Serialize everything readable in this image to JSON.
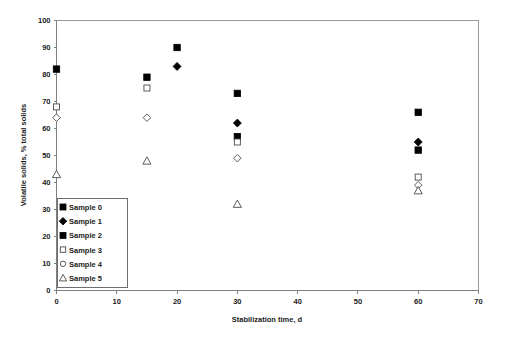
{
  "chart_data": {
    "type": "scatter",
    "title": "",
    "xlabel": "Stabilization time, d",
    "ylabel": "Volatile solids, % total solids",
    "xlim": [
      0,
      70
    ],
    "ylim": [
      0,
      100
    ],
    "xticks": [
      0,
      10,
      20,
      30,
      40,
      50,
      60,
      70
    ],
    "yticks": [
      0,
      10,
      20,
      30,
      40,
      50,
      60,
      70,
      80,
      90,
      100
    ],
    "grid": false,
    "legend_position": "lower-left-inside",
    "series": [
      {
        "name": "Sample 0",
        "marker": "filled-square",
        "x": [
          0,
          15,
          20,
          30,
          60
        ],
        "y": [
          82,
          79,
          90,
          73,
          66
        ]
      },
      {
        "name": "Sample 1",
        "marker": "filled-diamond",
        "x": [
          20,
          30,
          60
        ],
        "y": [
          83,
          62,
          55
        ]
      },
      {
        "name": "Sample 2",
        "marker": "filled-square",
        "x": [
          30,
          60
        ],
        "y": [
          57,
          52
        ]
      },
      {
        "name": "Sample 3",
        "marker": "open-square",
        "x": [
          0,
          15,
          30,
          60
        ],
        "y": [
          68,
          75,
          55,
          42
        ]
      },
      {
        "name": "Sample 4",
        "marker": "open-diamond",
        "x": [
          0,
          15,
          30,
          60
        ],
        "y": [
          64,
          64,
          49,
          39
        ]
      },
      {
        "name": "Sample 5",
        "marker": "open-triangle",
        "x": [
          0,
          15,
          30,
          60
        ],
        "y": [
          43,
          48,
          32,
          37
        ]
      }
    ]
  },
  "axes": {
    "x_tick_labels": [
      "0",
      "10",
      "20",
      "30",
      "40",
      "50",
      "60",
      "70"
    ],
    "y_tick_labels": [
      "0",
      "10",
      "20",
      "30",
      "40",
      "50",
      "60",
      "70",
      "80",
      "90",
      "100"
    ],
    "x_title": "Stabilization time, d",
    "y_title": "Volatile solids, % total solids"
  },
  "legend": {
    "items": [
      {
        "label": "Sample 0",
        "marker": "filled-square"
      },
      {
        "label": "Sample 1",
        "marker": "filled-diamond"
      },
      {
        "label": "Sample 2",
        "marker": "filled-square"
      },
      {
        "label": "Sample 3",
        "marker": "open-square"
      },
      {
        "label": "Sample 4",
        "marker": "open-circle"
      },
      {
        "label": "Sample 5",
        "marker": "open-triangle"
      }
    ]
  },
  "colors": {
    "marker_fill": "#000000",
    "marker_open_stroke": "#4a4a4a",
    "axis": "#808080",
    "frame": "#9a9a9a",
    "background": "#ffffff",
    "text": "#1a1a1a"
  }
}
